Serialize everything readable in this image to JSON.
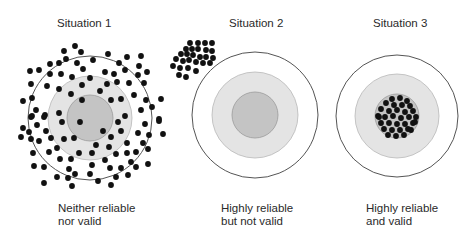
{
  "situations": [
    {
      "title": "Situation 1",
      "caption_line1": "Neither reliable",
      "caption_line2": "nor valid",
      "target": {
        "cx": 90,
        "cy": 118,
        "outer_r": 62,
        "middle_r": 42,
        "inner_r": 23
      },
      "dots": [
        [
          75,
          46
        ],
        [
          64,
          51
        ],
        [
          81,
          52
        ],
        [
          50,
          64
        ],
        [
          59,
          63
        ],
        [
          66,
          59
        ],
        [
          77,
          63
        ],
        [
          30,
          71
        ],
        [
          39,
          70
        ],
        [
          50,
          74
        ],
        [
          61,
          74
        ],
        [
          72,
          77
        ],
        [
          83,
          69
        ],
        [
          31,
          84
        ],
        [
          47,
          86
        ],
        [
          59,
          89
        ],
        [
          82,
          85
        ],
        [
          23,
          101
        ],
        [
          32,
          98
        ],
        [
          71,
          94
        ],
        [
          82,
          100
        ],
        [
          36,
          110
        ],
        [
          45,
          115
        ],
        [
          59,
          113
        ],
        [
          32,
          116
        ],
        [
          108,
          54
        ],
        [
          127,
          57
        ],
        [
          141,
          56
        ],
        [
          93,
          60
        ],
        [
          119,
          63
        ],
        [
          139,
          66
        ],
        [
          105,
          72
        ],
        [
          114,
          74
        ],
        [
          125,
          70
        ],
        [
          138,
          75
        ],
        [
          147,
          72
        ],
        [
          90,
          78
        ],
        [
          107,
          84
        ],
        [
          117,
          82
        ],
        [
          129,
          83
        ],
        [
          144,
          83
        ],
        [
          100,
          91
        ],
        [
          134,
          95
        ],
        [
          146,
          100
        ],
        [
          161,
          99
        ],
        [
          111,
          100
        ],
        [
          121,
          99
        ],
        [
          141,
          110
        ],
        [
          152,
          107
        ],
        [
          125,
          116
        ],
        [
          159,
          119
        ],
        [
          31,
          117
        ],
        [
          44,
          117
        ],
        [
          62,
          122
        ],
        [
          80,
          122
        ],
        [
          23,
          128
        ],
        [
          37,
          125
        ],
        [
          29,
          132
        ],
        [
          21,
          137
        ],
        [
          46,
          131
        ],
        [
          31,
          139
        ],
        [
          39,
          141
        ],
        [
          51,
          138
        ],
        [
          64,
          139
        ],
        [
          74,
          138
        ],
        [
          57,
          148
        ],
        [
          33,
          153
        ],
        [
          49,
          152
        ],
        [
          79,
          153
        ],
        [
          60,
          159
        ],
        [
          71,
          159
        ],
        [
          34,
          166
        ],
        [
          44,
          167
        ],
        [
          69,
          169
        ],
        [
          75,
          174
        ],
        [
          57,
          177
        ],
        [
          68,
          178
        ],
        [
          44,
          183
        ],
        [
          72,
          186
        ],
        [
          118,
          122
        ],
        [
          145,
          124
        ],
        [
          159,
          121
        ],
        [
          103,
          131
        ],
        [
          121,
          131
        ],
        [
          138,
          133
        ],
        [
          149,
          135
        ],
        [
          163,
          134
        ],
        [
          111,
          137
        ],
        [
          96,
          145
        ],
        [
          109,
          147
        ],
        [
          127,
          143
        ],
        [
          143,
          143
        ],
        [
          148,
          149
        ],
        [
          92,
          153
        ],
        [
          116,
          154
        ],
        [
          127,
          153
        ],
        [
          136,
          152
        ],
        [
          105,
          160
        ],
        [
          131,
          162
        ],
        [
          92,
          165
        ],
        [
          110,
          168
        ],
        [
          121,
          168
        ],
        [
          136,
          167
        ],
        [
          148,
          164
        ],
        [
          90,
          174
        ],
        [
          116,
          177
        ],
        [
          128,
          175
        ],
        [
          98,
          181
        ],
        [
          111,
          185
        ]
      ]
    },
    {
      "title": "Situation 2",
      "caption_line1": "Highly reliable",
      "caption_line2": "but not valid",
      "target": {
        "cx": 255,
        "cy": 115,
        "outer_r": 63,
        "middle_r": 43,
        "inner_r": 23
      },
      "dots": [
        [
          190,
          43
        ],
        [
          198,
          43
        ],
        [
          205,
          43
        ],
        [
          212,
          43
        ],
        [
          186,
          49
        ],
        [
          192,
          49
        ],
        [
          198,
          49
        ],
        [
          206,
          50
        ],
        [
          212,
          51
        ],
        [
          181,
          54
        ],
        [
          187,
          54
        ],
        [
          193,
          55
        ],
        [
          200,
          57
        ],
        [
          206,
          57
        ],
        [
          213,
          58
        ],
        [
          176,
          59
        ],
        [
          183,
          61
        ],
        [
          189,
          60
        ],
        [
          196,
          62
        ],
        [
          203,
          63
        ],
        [
          210,
          63
        ],
        [
          173,
          66
        ],
        [
          180,
          68
        ],
        [
          188,
          68
        ],
        [
          196,
          71
        ],
        [
          179,
          75
        ],
        [
          186,
          77
        ]
      ]
    },
    {
      "title": "Situation 3",
      "caption_line1": "Highly reliable",
      "caption_line2": "and valid",
      "target": {
        "cx": 397,
        "cy": 116,
        "outer_r": 61,
        "middle_r": 42,
        "inner_r": 22
      },
      "dots": [
        [
          392,
          99
        ],
        [
          400,
          98
        ],
        [
          407,
          101
        ],
        [
          386,
          103
        ],
        [
          394,
          105
        ],
        [
          402,
          105
        ],
        [
          410,
          106
        ],
        [
          381,
          109
        ],
        [
          389,
          111
        ],
        [
          397,
          110
        ],
        [
          405,
          112
        ],
        [
          413,
          111
        ],
        [
          378,
          116
        ],
        [
          385,
          117
        ],
        [
          393,
          116
        ],
        [
          401,
          118
        ],
        [
          409,
          117
        ],
        [
          416,
          117
        ],
        [
          381,
          123
        ],
        [
          389,
          123
        ],
        [
          397,
          124
        ],
        [
          405,
          124
        ],
        [
          413,
          123
        ],
        [
          384,
          129
        ],
        [
          392,
          130
        ],
        [
          400,
          130
        ],
        [
          408,
          129
        ],
        [
          388,
          135
        ],
        [
          396,
          136
        ],
        [
          404,
          135
        ],
        [
          411,
          130
        ],
        [
          379,
          117
        ],
        [
          415,
          122
        ]
      ]
    }
  ],
  "colors": {
    "outer_fill": "#ffffff",
    "outer_stroke": "#555555",
    "middle_fill": "#e4e4e4",
    "middle_stroke": "#b8b8b8",
    "inner_fill": "#c4c4c4",
    "inner_stroke": "#9a9a9a",
    "dot": "#111111"
  }
}
